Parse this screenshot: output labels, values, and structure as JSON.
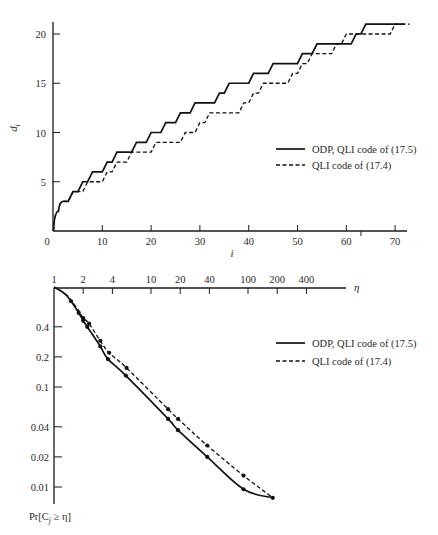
{
  "chart_data": [
    {
      "type": "line",
      "title": "",
      "xlabel": "i",
      "ylabel": "d_i",
      "xlim": [
        0,
        73
      ],
      "ylim": [
        0,
        21
      ],
      "x_ticks": [
        "0",
        "10",
        "20",
        "30",
        "40",
        "50",
        "60",
        "70"
      ],
      "y_ticks": [
        "5",
        "10",
        "15",
        "20"
      ],
      "grid": false,
      "legend_position": "right-middle",
      "series": [
        {
          "name": "ODP, QLI code of (17.5)",
          "style": "solid",
          "step_points": [
            [
              0,
              0
            ],
            [
              1,
              2
            ],
            [
              2,
              3
            ],
            [
              3,
              3
            ],
            [
              4,
              4
            ],
            [
              5,
              4
            ],
            [
              6,
              5
            ],
            [
              7,
              5
            ],
            [
              8,
              6
            ],
            [
              10,
              6
            ],
            [
              11,
              7
            ],
            [
              12,
              7
            ],
            [
              13,
              8
            ],
            [
              16,
              8
            ],
            [
              17,
              9
            ],
            [
              19,
              9
            ],
            [
              20,
              10
            ],
            [
              22,
              10
            ],
            [
              23,
              11
            ],
            [
              25,
              11
            ],
            [
              26,
              12
            ],
            [
              28,
              12
            ],
            [
              29,
              13
            ],
            [
              33,
              13
            ],
            [
              34,
              14
            ],
            [
              35,
              14
            ],
            [
              36,
              15
            ],
            [
              40,
              15
            ],
            [
              41,
              16
            ],
            [
              44,
              16
            ],
            [
              45,
              17
            ],
            [
              50,
              17
            ],
            [
              51,
              18
            ],
            [
              53,
              18
            ],
            [
              54,
              19
            ],
            [
              61,
              19
            ],
            [
              62,
              20
            ],
            [
              63,
              20
            ],
            [
              64,
              21
            ],
            [
              72,
              21
            ]
          ]
        },
        {
          "name": "QLI code of (17.4)",
          "style": "dashed",
          "step_points": [
            [
              0,
              0
            ],
            [
              1,
              2
            ],
            [
              2,
              3
            ],
            [
              3,
              3
            ],
            [
              4,
              4
            ],
            [
              5,
              4
            ],
            [
              6,
              4
            ],
            [
              7,
              5
            ],
            [
              10,
              5
            ],
            [
              11,
              6
            ],
            [
              12,
              6
            ],
            [
              13,
              7
            ],
            [
              15,
              7
            ],
            [
              16,
              8
            ],
            [
              20,
              8
            ],
            [
              21,
              9
            ],
            [
              26,
              9
            ],
            [
              27,
              10
            ],
            [
              29,
              10
            ],
            [
              30,
              11
            ],
            [
              31,
              11
            ],
            [
              32,
              12
            ],
            [
              38,
              12
            ],
            [
              39,
              13
            ],
            [
              40,
              13
            ],
            [
              41,
              14
            ],
            [
              42,
              14
            ],
            [
              43,
              15
            ],
            [
              48,
              15
            ],
            [
              49,
              16
            ],
            [
              50,
              16
            ],
            [
              51,
              17
            ],
            [
              52,
              17
            ],
            [
              53,
              18
            ],
            [
              57,
              18
            ],
            [
              58,
              19
            ],
            [
              59,
              19
            ],
            [
              60,
              20
            ],
            [
              69,
              20
            ],
            [
              70,
              21
            ],
            [
              73,
              21
            ]
          ]
        }
      ]
    },
    {
      "type": "line",
      "title": "",
      "xlabel": "η",
      "ylabel": "Pr[C_j ≥ η]",
      "x_scale": "log",
      "y_scale": "log",
      "xlim": [
        1,
        600
      ],
      "ylim": [
        0.007,
        1
      ],
      "x_ticks": [
        "1",
        "2",
        "4",
        "10",
        "20",
        "40",
        "100",
        "200",
        "400"
      ],
      "y_ticks": [
        "0.4",
        "0.2",
        "0.1",
        "0.04",
        "0.02",
        "0.01"
      ],
      "grid": false,
      "legend_position": "right-upper",
      "series": [
        {
          "name": "ODP, QLI code of (17.5)",
          "style": "solid",
          "points": [
            [
              1,
              1.0
            ],
            [
              1.3,
              0.85
            ],
            [
              1.5,
              0.72
            ],
            [
              1.8,
              0.55
            ],
            [
              2.0,
              0.46
            ],
            [
              2.2,
              0.4
            ],
            [
              3.0,
              0.255
            ],
            [
              3.6,
              0.19
            ],
            [
              5.5,
              0.13
            ],
            [
              15,
              0.048
            ],
            [
              19,
              0.037
            ],
            [
              38,
              0.02
            ],
            [
              90,
              0.0095
            ],
            [
              180,
              0.0078
            ]
          ]
        },
        {
          "name": "QLI code of (17.4)",
          "style": "dashed",
          "points": [
            [
              1,
              1.0
            ],
            [
              1.3,
              0.86
            ],
            [
              1.5,
              0.74
            ],
            [
              1.8,
              0.58
            ],
            [
              2.0,
              0.49
            ],
            [
              2.3,
              0.43
            ],
            [
              3.0,
              0.29
            ],
            [
              3.7,
              0.22
            ],
            [
              5.6,
              0.155
            ],
            [
              15,
              0.06
            ],
            [
              19,
              0.048
            ],
            [
              38,
              0.026
            ],
            [
              90,
              0.013
            ],
            [
              180,
              0.0078
            ]
          ]
        }
      ]
    }
  ],
  "top_chart": {
    "x_ticks": [
      {
        "label": "0",
        "value": 0
      },
      {
        "label": "10",
        "value": 10
      },
      {
        "label": "20",
        "value": 20
      },
      {
        "label": "30",
        "value": 30
      },
      {
        "label": "40",
        "value": 40
      },
      {
        "label": "50",
        "value": 50
      },
      {
        "label": "60",
        "value": 60
      },
      {
        "label": "70",
        "value": 70
      }
    ],
    "y_ticks": [
      {
        "label": "5",
        "value": 5
      },
      {
        "label": "10",
        "value": 10
      },
      {
        "label": "15",
        "value": 15
      },
      {
        "label": "20",
        "value": 20
      }
    ],
    "xlabel": "i",
    "ylabel": "d",
    "ylabel_sub": "i",
    "legend": [
      {
        "label": "ODP, QLI code of (17.5)",
        "style": "solid"
      },
      {
        "label": "QLI code of (17.4)",
        "style": "dashed"
      }
    ]
  },
  "bottom_chart": {
    "x_ticks": [
      {
        "label": "1",
        "value": 1
      },
      {
        "label": "2",
        "value": 2
      },
      {
        "label": "4",
        "value": 4
      },
      {
        "label": "10",
        "value": 10
      },
      {
        "label": "20",
        "value": 20
      },
      {
        "label": "40",
        "value": 40
      },
      {
        "label": "100",
        "value": 100
      },
      {
        "label": "200",
        "value": 200
      },
      {
        "label": "400",
        "value": 400
      }
    ],
    "y_ticks": [
      {
        "label": "0.4",
        "value": 0.4
      },
      {
        "label": "0.2",
        "value": 0.2
      },
      {
        "label": "0.1",
        "value": 0.1
      },
      {
        "label": "0.04",
        "value": 0.04
      },
      {
        "label": "0.02",
        "value": 0.02
      },
      {
        "label": "0.01",
        "value": 0.01
      }
    ],
    "xlabel": "η",
    "ylabel": "Pr[C",
    "ylabel_sub": "j",
    "ylabel_rest": " ≥ η]",
    "legend": [
      {
        "label": "ODP, QLI code of (17.5)",
        "style": "solid"
      },
      {
        "label": "QLI code of (17.4)",
        "style": "dashed"
      }
    ],
    "markers": {
      "solid": [
        [
          1.5,
          0.72
        ],
        [
          1.8,
          0.55
        ],
        [
          2.0,
          0.46
        ],
        [
          2.2,
          0.4
        ],
        [
          3.0,
          0.255
        ],
        [
          3.6,
          0.19
        ],
        [
          5.5,
          0.13
        ],
        [
          15,
          0.048
        ],
        [
          19,
          0.037
        ],
        [
          38,
          0.02
        ],
        [
          90,
          0.0095
        ],
        [
          180,
          0.0078
        ]
      ],
      "dashed": [
        [
          2.0,
          0.49
        ],
        [
          2.3,
          0.43
        ],
        [
          3.0,
          0.29
        ],
        [
          3.7,
          0.22
        ],
        [
          5.6,
          0.155
        ],
        [
          15,
          0.06
        ],
        [
          19,
          0.048
        ],
        [
          38,
          0.026
        ],
        [
          90,
          0.013
        ]
      ]
    }
  }
}
